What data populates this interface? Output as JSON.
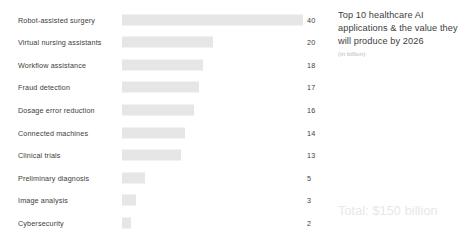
{
  "chart_data": {
    "type": "bar",
    "orientation": "horizontal",
    "title": "Top 10 healthcare AI applications & the value they will produce by 2026",
    "subtitle": "(in billion)",
    "xlabel": "",
    "ylabel": "",
    "xlim": [
      0,
      40
    ],
    "grid": false,
    "legend": "none",
    "categories": [
      "Robot-assisted surgery",
      "Virtual nursing assistants",
      "Workflow assistance",
      "Fraud detection",
      "Dosage error reduction",
      "Connected machines",
      "Clinical trials",
      "Preliminary diagnosis",
      "Image analysis",
      "Cybersecurity"
    ],
    "values": [
      40,
      20,
      18,
      17,
      16,
      14,
      13,
      5,
      3,
      2
    ],
    "value_labels": [
      "40",
      "20",
      "18",
      "17",
      "16",
      "14",
      "13",
      "5",
      "3",
      "2"
    ],
    "annotations": [
      "Total: $150 billion"
    ],
    "bar_color": "#e6e6e6",
    "label_color": "#3d3d3d",
    "background_color": "#ffffff"
  },
  "caption": {
    "title": "Top 10 healthcare AI applications & the value they will produce by 2026",
    "subtitle": "(in billion)"
  },
  "footer": {
    "total": "Total: $150 billion"
  },
  "rows": [
    {
      "label": "Robot-assisted surgery",
      "value": 40,
      "value_text": "40"
    },
    {
      "label": "Virtual nursing assistants",
      "value": 20,
      "value_text": "20"
    },
    {
      "label": "Workflow assistance",
      "value": 18,
      "value_text": "18"
    },
    {
      "label": "Fraud detection",
      "value": 17,
      "value_text": "17"
    },
    {
      "label": "Dosage error reduction",
      "value": 16,
      "value_text": "16"
    },
    {
      "label": "Connected machines",
      "value": 14,
      "value_text": "14"
    },
    {
      "label": "Clinical trials",
      "value": 13,
      "value_text": "13"
    },
    {
      "label": "Preliminary diagnosis",
      "value": 5,
      "value_text": "5"
    },
    {
      "label": "Image analysis",
      "value": 3,
      "value_text": "3"
    },
    {
      "label": "Cybersecurity",
      "value": 2,
      "value_text": "2"
    }
  ],
  "layout": {
    "row_top_start": 8,
    "row_step": 22.6,
    "bar_max_px": 181,
    "value_max": 40
  }
}
